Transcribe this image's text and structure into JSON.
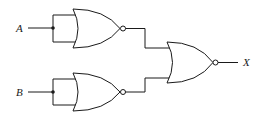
{
  "diagram": {
    "type": "logic-circuit",
    "inputs": [
      {
        "label": "A"
      },
      {
        "label": "B"
      }
    ],
    "output": {
      "label": "X"
    },
    "gates": [
      {
        "id": "gate-1",
        "kind": "NOR",
        "inputs": [
          "A",
          "A"
        ]
      },
      {
        "id": "gate-2",
        "kind": "NOR",
        "inputs": [
          "B",
          "B"
        ]
      },
      {
        "id": "gate-3",
        "kind": "NOR",
        "inputs": [
          "gate-1",
          "gate-2"
        ],
        "output": "X"
      }
    ],
    "colors": {
      "line": "#1a1a1a",
      "background": "#ffffff"
    }
  }
}
